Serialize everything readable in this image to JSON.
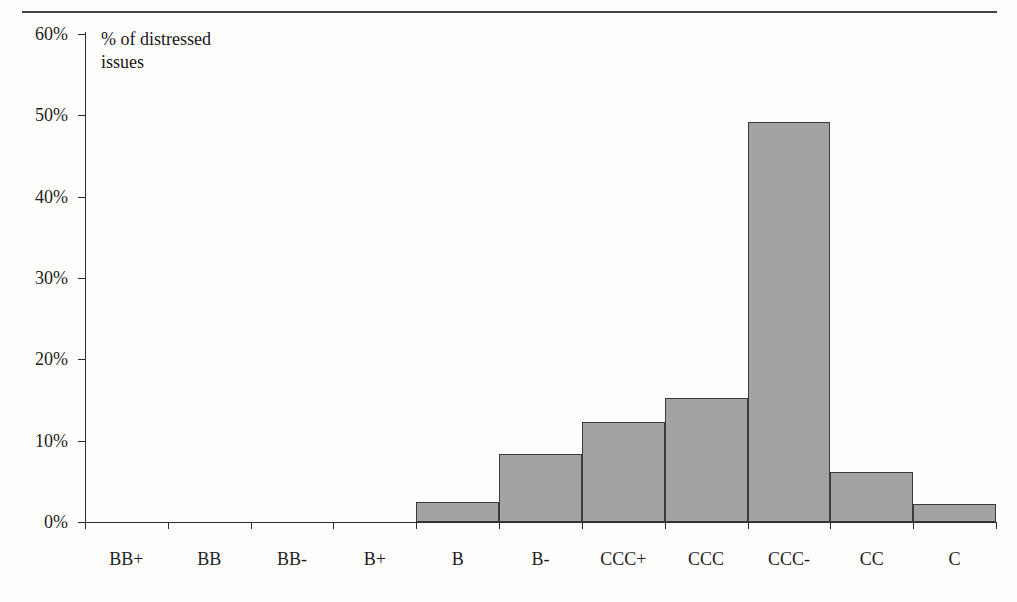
{
  "page": {
    "page_number": "",
    "rule_name": "top-horizontal-rule"
  },
  "annotation": {
    "text": "% of distressed\nissues"
  },
  "chart_data": {
    "type": "bar",
    "title": "",
    "subtitle": "",
    "xlabel": "",
    "ylabel": "% of distressed issues",
    "ylim": [
      0,
      60
    ],
    "ytick_labels": [
      "0%",
      "10%",
      "20%",
      "30%",
      "40%",
      "50%",
      "60%"
    ],
    "ytick_values": [
      0,
      10,
      20,
      30,
      40,
      50,
      60
    ],
    "grid": false,
    "legend": "none",
    "annotations": [
      "% of distressed issues"
    ],
    "bar_color": "#a3a3a3",
    "bar_edge_color": "#3a3a3a",
    "axis_color": "#2b2b2b",
    "categories": [
      "BB+",
      "BB",
      "BB-",
      "B+",
      "B",
      "B-",
      "CCC+",
      "CCC",
      "CCC-",
      "CC",
      "C"
    ],
    "values": [
      0,
      0,
      0,
      0,
      2.5,
      8.4,
      12.3,
      15.3,
      49.2,
      6.2,
      2.2
    ],
    "value_unit": "%"
  }
}
